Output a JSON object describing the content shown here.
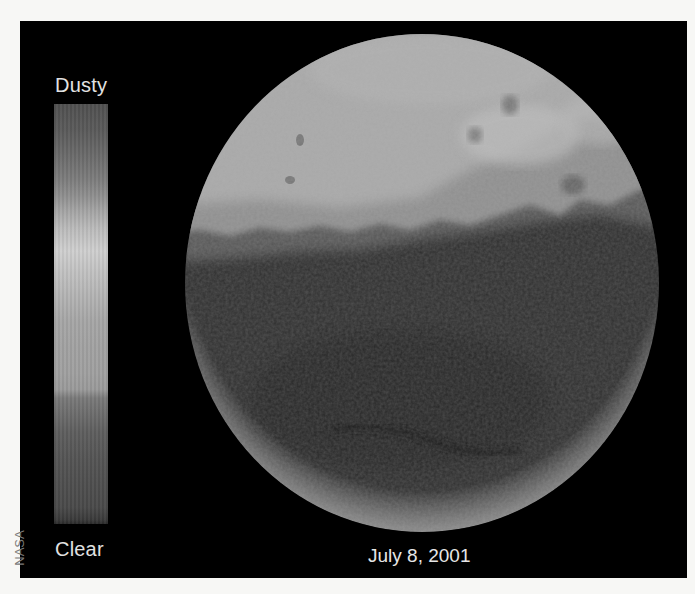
{
  "figure": {
    "credit": "NASA",
    "date_label": "July 8, 2001",
    "colorbar": {
      "top_label": "Dusty",
      "bottom_label": "Clear",
      "colormap": "grayscale"
    },
    "subject": {
      "name": "Mars disc",
      "description": "Grayscale map of Mars showing atmospheric dust opacity; dusty (light) upper region, clear (dark) lower region, bright rim at lower limb"
    },
    "colors": {
      "background": "#f7f7f5",
      "panel": "#000000",
      "text": "#e2e2e2",
      "credit_text": "#7a7a7a"
    }
  }
}
